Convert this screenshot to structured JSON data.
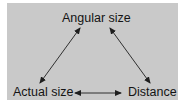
{
  "diagram": {
    "type": "triangle-relationship",
    "nodes": {
      "angular_size": "Angular size",
      "actual_size": "Actual size",
      "distance": "Distance"
    },
    "edges": [
      {
        "from": "angular_size",
        "to": "actual_size",
        "direction": "both"
      },
      {
        "from": "angular_size",
        "to": "distance",
        "direction": "both"
      },
      {
        "from": "actual_size",
        "to": "distance",
        "direction": "both"
      }
    ],
    "colors": {
      "background": "#c9c9c9",
      "text": "#141414",
      "arrow": "#1e1e1e"
    }
  }
}
